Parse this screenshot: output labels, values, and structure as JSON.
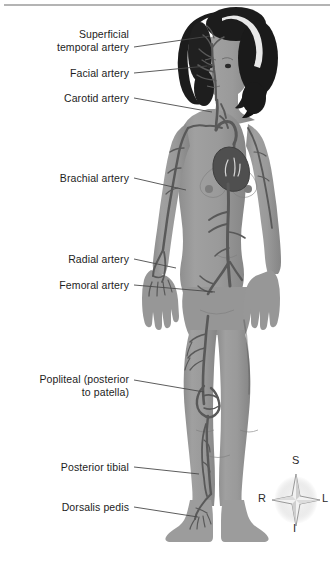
{
  "figure": {
    "background_color": "#ffffff",
    "skin_color": "#9a9a9a",
    "skin_shadow_color": "#808080",
    "artery_color": "#595959",
    "hair_color": "#1c1c1c",
    "headband_color": "#e8e8e8",
    "rule_color": "#b4b4b4",
    "leader_color": "#4a4a4a",
    "text_color": "#1d1d1d"
  },
  "labels": [
    {
      "id": "superficial-temporal-artery",
      "lines": [
        "Superficial",
        "temporal artery"
      ],
      "text_right": 129,
      "text_top": 28,
      "leader": {
        "x1": 134,
        "y1": 47,
        "x2": 210,
        "y2": 36
      }
    },
    {
      "id": "facial-artery",
      "lines": [
        "Facial artery"
      ],
      "text_right": 129,
      "text_top": 67,
      "leader": {
        "x1": 134,
        "y1": 73,
        "x2": 207,
        "y2": 66
      }
    },
    {
      "id": "carotid-artery",
      "lines": [
        "Carotid artery"
      ],
      "text_right": 129,
      "text_top": 92,
      "leader": {
        "x1": 134,
        "y1": 98,
        "x2": 212,
        "y2": 112
      }
    },
    {
      "id": "brachial-artery",
      "lines": [
        "Brachial artery"
      ],
      "text_right": 129,
      "text_top": 172,
      "leader": {
        "x1": 134,
        "y1": 178,
        "x2": 186,
        "y2": 190
      }
    },
    {
      "id": "radial-artery",
      "lines": [
        "Radial artery"
      ],
      "text_right": 129,
      "text_top": 253,
      "leader": {
        "x1": 134,
        "y1": 259,
        "x2": 176,
        "y2": 268
      }
    },
    {
      "id": "femoral-artery",
      "lines": [
        "Femoral artery"
      ],
      "text_right": 129,
      "text_top": 279,
      "leader": {
        "x1": 134,
        "y1": 285,
        "x2": 215,
        "y2": 292
      }
    },
    {
      "id": "popliteal-artery",
      "lines": [
        "Popliteal (posterior",
        "to patella)"
      ],
      "text_right": 129,
      "text_top": 373,
      "leader": {
        "x1": 134,
        "y1": 380,
        "x2": 204,
        "y2": 392
      }
    },
    {
      "id": "posterior-tibial-artery",
      "lines": [
        "Posterior tibial"
      ],
      "text_right": 129,
      "text_top": 461,
      "leader": {
        "x1": 134,
        "y1": 467,
        "x2": 199,
        "y2": 474
      }
    },
    {
      "id": "dorsalis-pedis-artery",
      "lines": [
        "Dorsalis pedis"
      ],
      "text_right": 129,
      "text_top": 501,
      "leader": {
        "x1": 134,
        "y1": 507,
        "x2": 198,
        "y2": 517
      }
    }
  ],
  "compass": {
    "name": "anatomical-orientation-compass",
    "superior": "S",
    "inferior": "I",
    "right": "R",
    "left": "L"
  }
}
